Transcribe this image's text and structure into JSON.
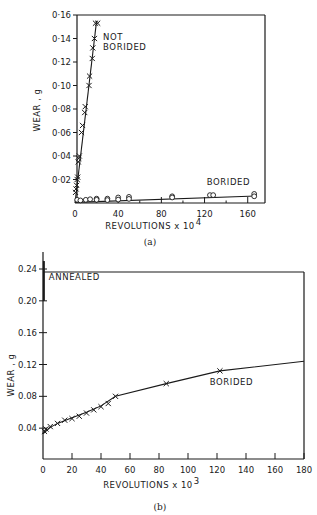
{
  "chart_data": [
    {
      "id": "a",
      "type": "scatter",
      "caption": "(a)",
      "title": "",
      "xlabel": "REVOLUTIONS x 10",
      "xlabel_exp": "4",
      "ylabel": "WEAR , g",
      "xlim": [
        0,
        176
      ],
      "ylim": [
        0,
        0.16
      ],
      "xticks": [
        0,
        40,
        80,
        120,
        160
      ],
      "xminor": [
        20,
        60,
        100,
        140
      ],
      "yticks": [
        0.02,
        0.04,
        0.06,
        0.08,
        0.1,
        0.12,
        0.14,
        0.16
      ],
      "ytick_labels": [
        "0·02",
        "0·04",
        "0·06",
        "0·08",
        "0·10",
        "0·12",
        "0·14",
        "0·16"
      ],
      "grid": false,
      "series": [
        {
          "name": "NOT BORIDED",
          "marker": "x",
          "line": [
            [
              0,
              0.0
            ],
            [
              20,
              0.155
            ]
          ],
          "points": [
            [
              0.5,
              0.009
            ],
            [
              1,
              0.012
            ],
            [
              1.5,
              0.015
            ],
            [
              2,
              0.02
            ],
            [
              2.5,
              0.022
            ],
            [
              3,
              0.035
            ],
            [
              3.5,
              0.038
            ],
            [
              4,
              0.04
            ],
            [
              6,
              0.06
            ],
            [
              7,
              0.066
            ],
            [
              9,
              0.077
            ],
            [
              9.5,
              0.082
            ],
            [
              13,
              0.1
            ],
            [
              13.5,
              0.108
            ],
            [
              16,
              0.123
            ],
            [
              16.5,
              0.132
            ],
            [
              18,
              0.14
            ],
            [
              19,
              0.153
            ],
            [
              21,
              0.153
            ]
          ]
        },
        {
          "name": "BORIDED",
          "marker": "o",
          "line": [
            [
              0,
              0.0005
            ],
            [
              168,
              0.006
            ]
          ],
          "points": [
            [
              2,
              0.001
            ],
            [
              5,
              0.0005
            ],
            [
              10,
              0.001
            ],
            [
              14,
              0.0015
            ],
            [
              20,
              0.002
            ],
            [
              20,
              0.001
            ],
            [
              30,
              0.002
            ],
            [
              30,
              0.0008
            ],
            [
              40,
              0.003
            ],
            [
              40,
              0.0012
            ],
            [
              50,
              0.0035
            ],
            [
              50,
              0.0018
            ],
            [
              90,
              0.004
            ],
            [
              90,
              0.003
            ],
            [
              125,
              0.005
            ],
            [
              128,
              0.005
            ],
            [
              166,
              0.006
            ],
            [
              166,
              0.004
            ]
          ]
        }
      ],
      "annotations": [
        {
          "text": "NOT",
          "x": 26,
          "y": 0.139
        },
        {
          "text": "BORIDED",
          "x": 26,
          "y": 0.13
        },
        {
          "text": "BORIDED",
          "x": 122,
          "y": 0.015
        }
      ]
    },
    {
      "id": "b",
      "type": "line",
      "caption": "(b)",
      "title": "",
      "xlabel": "REVOLUTIONS x 10",
      "xlabel_exp": "3",
      "ylabel": "WEAR , g",
      "xlim": [
        0,
        180
      ],
      "ylim": [
        0,
        0.24
      ],
      "xticks": [
        0,
        20,
        40,
        60,
        80,
        100,
        120,
        140,
        160,
        180
      ],
      "yticks": [
        0.04,
        0.08,
        0.12,
        0.16,
        0.2,
        0.24
      ],
      "ytick_labels": [
        "0.04",
        "0.08",
        "0.12",
        "0.16",
        "0.20",
        "0.24"
      ],
      "grid": false,
      "series": [
        {
          "name": "ANNEALED",
          "marker": "none",
          "line": [
            [
              0.6,
              0.2
            ],
            [
              0.6,
              0.25
            ]
          ],
          "points": []
        },
        {
          "name": "BORIDED",
          "marker": "x",
          "line": [
            [
              0,
              0.033
            ],
            [
              5,
              0.041
            ],
            [
              10,
              0.046
            ],
            [
              20,
              0.053
            ],
            [
              30,
              0.06
            ],
            [
              40,
              0.068
            ],
            [
              50,
              0.08
            ],
            [
              85,
              0.096
            ],
            [
              122,
              0.112
            ],
            [
              180,
              0.124
            ]
          ],
          "points": [
            [
              1,
              0.036
            ],
            [
              2,
              0.039
            ],
            [
              5,
              0.042
            ],
            [
              10,
              0.046
            ],
            [
              15,
              0.05
            ],
            [
              20,
              0.052
            ],
            [
              25,
              0.055
            ],
            [
              30,
              0.059
            ],
            [
              35,
              0.063
            ],
            [
              40,
              0.067
            ],
            [
              45,
              0.071
            ],
            [
              50,
              0.08
            ],
            [
              85,
              0.096
            ],
            [
              122,
              0.112
            ]
          ]
        }
      ],
      "annotations": [
        {
          "text": "ANNEALED",
          "x": 4,
          "y": 0.226
        },
        {
          "text": "BORIDED",
          "x": 115,
          "y": 0.094
        }
      ]
    }
  ]
}
